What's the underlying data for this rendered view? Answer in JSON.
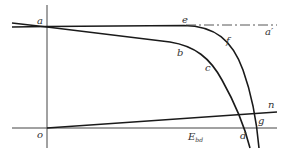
{
  "diagram": {
    "colors": {
      "line": "#1a1a1a",
      "axis": "#444444",
      "label": "#333333",
      "background": "#ffffff"
    },
    "labels": {
      "a": "a",
      "a_prime": "a′",
      "b": "b",
      "c": "c",
      "d": "d",
      "e": "e",
      "f": "f",
      "g": "g",
      "n": "n",
      "o": "o",
      "E_main": "E",
      "E_sub": "bd"
    },
    "curves": [
      {
        "name": "a-e-f-g",
        "description": "near-horizontal line from a to e then bending down through f to g"
      },
      {
        "name": "a-b-c-d",
        "description": "sloping line from a through b then bending down through c to d"
      },
      {
        "name": "e-a-prime",
        "description": "dash-dot extension from e to a′",
        "style": "dash-dot"
      },
      {
        "name": "o-n",
        "description": "straight line from origin o rising to n"
      }
    ]
  }
}
